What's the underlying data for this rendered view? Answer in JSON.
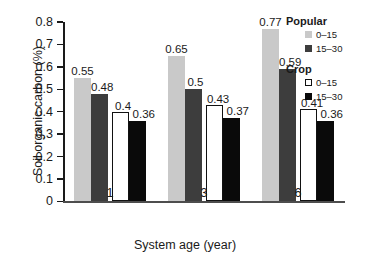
{
  "chart_data": {
    "type": "bar",
    "title": "",
    "xlabel": "System age (year)",
    "ylabel": "Soil organic carbon (%)",
    "categories": [
      "1",
      "3",
      "6"
    ],
    "ylim": [
      0,
      0.8
    ],
    "yticks": [
      "0",
      "0.1",
      "0.2",
      "0.3",
      "0.4",
      "0.5",
      "0.6",
      "0.7",
      "0.8"
    ],
    "grid": false,
    "legend_position": "top-right",
    "series": [
      {
        "name": "Popular 0–15",
        "group": "Popular",
        "depth": "0–15",
        "color": "#c9c9c9",
        "values": [
          0.55,
          0.65,
          0.77
        ],
        "labels": [
          "0.55",
          "0.65",
          "0.77"
        ]
      },
      {
        "name": "Popular 15–30",
        "group": "Popular",
        "depth": "15–30",
        "color": "#3d3d3d",
        "values": [
          0.48,
          0.5,
          0.59
        ],
        "labels": [
          "0.48",
          "0.5",
          "0.59"
        ]
      },
      {
        "name": "Crop 0–15",
        "group": "Crop",
        "depth": "0–15",
        "color": "#ffffff",
        "values": [
          0.4,
          0.43,
          0.41
        ],
        "labels": [
          "0.4",
          "0.43",
          "0.41"
        ]
      },
      {
        "name": "Crop 15–30",
        "group": "Crop",
        "depth": "15–30",
        "color": "#0a0a0a",
        "values": [
          0.36,
          0.37,
          0.36
        ],
        "labels": [
          "0.36",
          "0.37",
          "0.36"
        ]
      }
    ]
  },
  "legend": {
    "groups": [
      {
        "title": "Popular",
        "entries": [
          {
            "label": "0–15",
            "swatch": "pop-0-15"
          },
          {
            "label": "15–30",
            "swatch": "pop-15-30"
          }
        ]
      },
      {
        "title": "Crop",
        "entries": [
          {
            "label": "0–15",
            "swatch": "crop-0-15"
          },
          {
            "label": "15–30",
            "swatch": "crop-15-30"
          }
        ]
      }
    ]
  }
}
